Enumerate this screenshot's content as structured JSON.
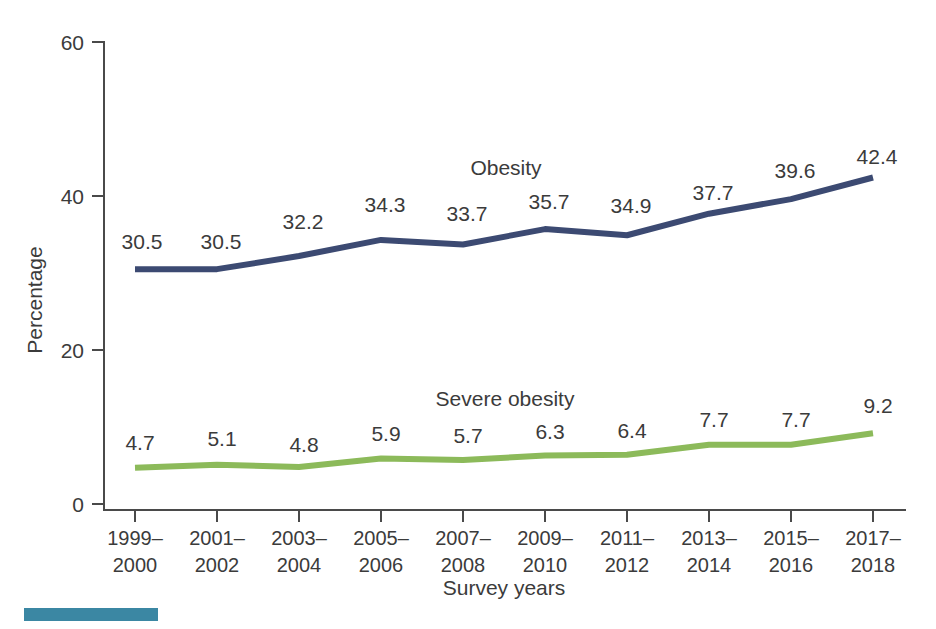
{
  "chart_data": {
    "type": "line",
    "title": "",
    "xlabel": "Survey years",
    "ylabel": "Percentage",
    "ylim": [
      0,
      60
    ],
    "yticks": [
      0,
      20,
      40,
      60
    ],
    "grid": false,
    "legend_position": "inline-annotation",
    "categories": [
      "1999–\n2000",
      "2001–\n2002",
      "2003–\n2004",
      "2005–\n2006",
      "2007–\n2008",
      "2009–\n2010",
      "2011–\n2012",
      "2013–\n2014",
      "2015–\n2016",
      "2017–\n2018"
    ],
    "categories_line1": [
      "1999–",
      "2001–",
      "2003–",
      "2005–",
      "2007–",
      "2009–",
      "2011–",
      "2013–",
      "2015–",
      "2017–"
    ],
    "categories_line2": [
      "2000",
      "2002",
      "2004",
      "2006",
      "2008",
      "2010",
      "2012",
      "2014",
      "2016",
      "2018"
    ],
    "series": [
      {
        "name": "Obesity",
        "color": "#3c4a72",
        "values": [
          30.5,
          30.5,
          32.2,
          34.3,
          33.7,
          35.7,
          34.9,
          37.7,
          39.6,
          42.4
        ],
        "labels": [
          "30.5",
          "30.5",
          "32.2",
          "34.3",
          "33.7",
          "35.7",
          "34.9",
          "37.7",
          "39.6",
          "42.4"
        ]
      },
      {
        "name": "Severe obesity",
        "color": "#8cba5a",
        "values": [
          4.7,
          5.1,
          4.8,
          5.9,
          5.7,
          6.3,
          6.4,
          7.7,
          7.7,
          9.2
        ],
        "labels": [
          "4.7",
          "5.1",
          "4.8",
          "5.9",
          "5.7",
          "6.3",
          "6.4",
          "7.7",
          "7.7",
          "9.2"
        ]
      }
    ],
    "ytick_labels": [
      "0",
      "20",
      "40",
      "60"
    ],
    "annotations": [
      {
        "text": "Obesity",
        "series": "Obesity"
      },
      {
        "text": "Severe obesity",
        "series": "Severe obesity"
      }
    ]
  },
  "colors": {
    "obesity_line": "#3c4a72",
    "severe_obesity_line": "#8cba5a",
    "axis": "#4a4a4a",
    "text": "#3b3b3b",
    "footer_accent": "#3b87a3"
  },
  "footer": {
    "accent_bar_label": "decorative-accent-bar"
  }
}
